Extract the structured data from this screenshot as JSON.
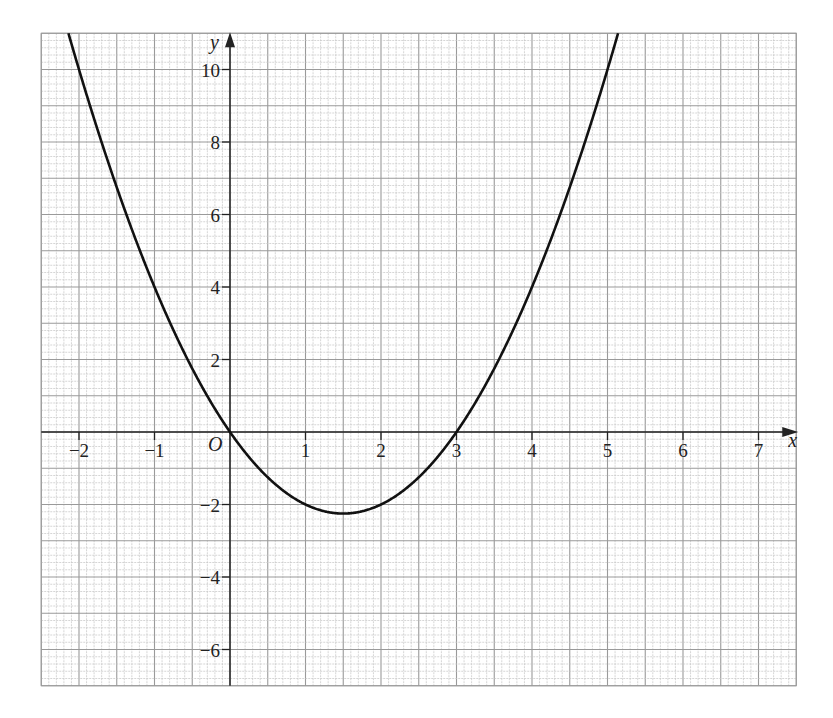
{
  "chart_data": {
    "type": "line",
    "title": "",
    "xlabel": "x",
    "ylabel": "y",
    "origin_label": "O",
    "xlim": [
      -2.5,
      7.5
    ],
    "ylim": [
      -7,
      11
    ],
    "grid": true,
    "x_ticks": [
      -2,
      -1,
      1,
      2,
      3,
      4,
      5,
      6,
      7
    ],
    "x_tick_labels": [
      "−2",
      "−1",
      "1",
      "2",
      "3",
      "4",
      "5",
      "6",
      "7"
    ],
    "y_ticks": [
      -6,
      -4,
      -2,
      2,
      4,
      6,
      8,
      10
    ],
    "y_tick_labels": [
      "−6",
      "−4",
      "−2",
      "2",
      "4",
      "6",
      "8",
      "10"
    ],
    "series": [
      {
        "name": "y = x^2 - 3x",
        "x": [
          -2.2,
          -2,
          -1.5,
          -1,
          -0.5,
          0,
          0.5,
          1,
          1.5,
          2,
          2.5,
          3,
          3.5,
          4,
          4.5,
          5,
          5.2
        ],
        "y": [
          11.44,
          10,
          6.75,
          4,
          1.75,
          0,
          -1.25,
          -2,
          -2.25,
          -2,
          -1.25,
          0,
          1.75,
          4,
          6.75,
          10,
          11.44
        ]
      }
    ],
    "annotations": [
      "O"
    ],
    "colors": {
      "curve": "#111111",
      "grid_minor": "#c4c4c4",
      "grid_major": "#9a9a9a",
      "axis": "#222222"
    }
  }
}
